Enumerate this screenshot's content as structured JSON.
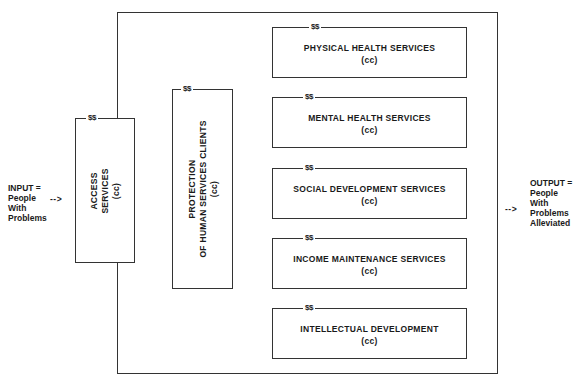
{
  "diagram": {
    "input": {
      "lines": [
        "INPUT =",
        "People",
        "With",
        "Problems"
      ],
      "arrow": "-->"
    },
    "output": {
      "lines": [
        "OUTPUT =",
        "People",
        "With",
        "Problems",
        "Alleviated"
      ],
      "arrow": "-->"
    },
    "access": {
      "money": "$$",
      "label_line1": "ACCESS",
      "label_line2": "SERVICES",
      "cc": "(cc)"
    },
    "protection": {
      "money": "$$",
      "label_line1": "PROTECTION",
      "label_line2": "OF HUMAN SERVICES CLIENTS",
      "cc": "(cc)"
    },
    "services": [
      {
        "money": "$$",
        "label": "PHYSICAL HEALTH SERVICES",
        "cc": "(cc)"
      },
      {
        "money": "$$",
        "label": "MENTAL HEALTH SERVICES",
        "cc": "(cc)"
      },
      {
        "money": "$$",
        "label": "SOCIAL DEVELOPMENT SERVICES",
        "cc": "(cc)"
      },
      {
        "money": "$$",
        "label": "INCOME MAINTENANCE SERVICES",
        "cc": "(cc)"
      },
      {
        "money": "$$",
        "label": "INTELLECTUAL DEVELOPMENT",
        "cc": "(cc)"
      }
    ]
  }
}
